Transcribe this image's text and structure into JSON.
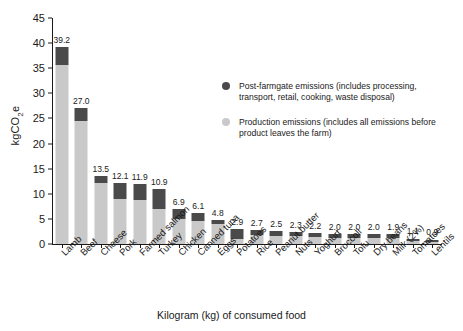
{
  "chart_data": {
    "type": "bar",
    "subtype": "stacked-bar",
    "title": "",
    "xlabel": "Kilogram (kg) of consumed food",
    "ylabel": "kgCO2e",
    "ylabel_rich": {
      "prefix": "kgCO",
      "sub": "2",
      "suffix": "e"
    },
    "ylim": [
      0,
      45
    ],
    "yticks": [
      0,
      5,
      10,
      15,
      20,
      25,
      30,
      35,
      40,
      45
    ],
    "grid": false,
    "legend_position": "inside-right",
    "categories": [
      "Lamb",
      "Beef",
      "Cheese",
      "Pork",
      "Farmed salmon",
      "Turkey",
      "Chicken",
      "Canned tuna",
      "Eggs",
      "Potatoes",
      "Rice",
      "Peanut butter",
      "Nuts",
      "Yoghurt",
      "Broccoli",
      "Tofu",
      "Dry beans",
      "Milk (2%)",
      "Tomatoes",
      "Lentils"
    ],
    "totals": [
      39.2,
      27.0,
      13.5,
      12.1,
      11.9,
      10.9,
      6.9,
      6.1,
      4.8,
      2.9,
      2.7,
      2.5,
      2.3,
      2.2,
      2.0,
      2.0,
      2.0,
      1.9,
      1.1,
      0.9
    ],
    "total_labels": [
      "39.2",
      "27.0",
      "13.5",
      "12.1",
      "11.9",
      "10.9",
      "6.9",
      "6.1",
      "4.8",
      "2.9",
      "2.7",
      "2.5",
      "2.3",
      "2.2",
      "2.0",
      "2.0",
      "2.0",
      "1.9",
      "1.1",
      "0.9"
    ],
    "series": [
      {
        "name": "Production emissions (includes all emissions before product leaves the farm)",
        "key": "production",
        "color": "#c9c9c9",
        "values": [
          35.6,
          24.5,
          12.1,
          8.9,
          8.7,
          7.0,
          4.9,
          4.6,
          3.9,
          0.9,
          1.7,
          1.6,
          1.5,
          1.3,
          1.2,
          1.2,
          1.2,
          1.1,
          0.6,
          0.5
        ]
      },
      {
        "name": "Post-farmgate emissions (includes processing, transport, retail, cooking, waste disposal)",
        "key": "post_farmgate",
        "color": "#4a4a4a",
        "values": [
          3.6,
          2.5,
          1.4,
          3.2,
          3.2,
          3.9,
          2.0,
          1.5,
          0.9,
          2.0,
          1.0,
          0.9,
          0.8,
          0.9,
          0.8,
          0.8,
          0.8,
          0.8,
          0.5,
          0.4
        ]
      }
    ]
  },
  "legend": {
    "items": [
      {
        "marker": "dark-circle",
        "label": "Post-farmgate emissions (includes processing, transport, retail, cooking, waste disposal)"
      },
      {
        "marker": "light-circle",
        "label": "Production emissions (includes all emissions before product leaves the farm)"
      }
    ]
  },
  "colors": {
    "post_farmgate": "#4a4a4a",
    "production": "#c9c9c9",
    "axis": "#1a1a1a",
    "background": "#ffffff"
  }
}
